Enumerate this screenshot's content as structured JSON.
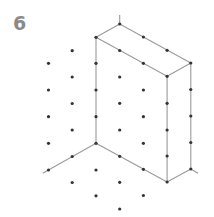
{
  "puzzle": {
    "number": "6",
    "title_color": "#8a8a8a"
  },
  "diagram": {
    "type": "isometric-dot-grid-drawing",
    "colors": {
      "dot": "#333333",
      "line": "#9a9a9a"
    },
    "dot_radius": 1.6,
    "dots": [
      [
        48.5,
        63.3
      ],
      [
        48.5,
        90
      ],
      [
        48.5,
        116.7
      ],
      [
        48.5,
        143.3
      ],
      [
        48.5,
        170
      ],
      [
        72.2,
        50.7
      ],
      [
        72.2,
        77
      ],
      [
        72.2,
        103.5
      ],
      [
        72.2,
        130
      ],
      [
        72.2,
        156.5
      ],
      [
        72.2,
        182.5
      ],
      [
        96,
        37.3
      ],
      [
        96,
        63.3
      ],
      [
        96,
        90
      ],
      [
        96,
        116.7
      ],
      [
        96,
        143.3
      ],
      [
        96,
        170
      ],
      [
        96,
        195.8
      ],
      [
        119.7,
        24
      ],
      [
        119.7,
        50.5
      ],
      [
        119.7,
        77
      ],
      [
        119.7,
        103.3
      ],
      [
        119.7,
        130
      ],
      [
        119.7,
        156.3
      ],
      [
        119.7,
        182.3
      ],
      [
        119.7,
        209
      ],
      [
        143.4,
        37
      ],
      [
        143.4,
        63.3
      ],
      [
        143.4,
        90
      ],
      [
        143.4,
        116.7
      ],
      [
        143.4,
        143.3
      ],
      [
        143.4,
        169.3
      ],
      [
        143.4,
        195.5
      ],
      [
        167.1,
        50.3
      ],
      [
        167.1,
        76.3
      ],
      [
        167.1,
        103.3
      ],
      [
        167.1,
        130
      ],
      [
        167.1,
        156
      ],
      [
        167.1,
        182
      ],
      [
        190.8,
        63
      ],
      [
        190.8,
        89.5
      ],
      [
        190.8,
        116
      ],
      [
        190.8,
        142.5
      ],
      [
        190.8,
        169
      ]
    ],
    "lines": [
      {
        "name": "box-top-left-edge",
        "from": [
          96,
          37.3
        ],
        "to": [
          119.7,
          24
        ]
      },
      {
        "name": "box-top-back-edge",
        "from": [
          119.7,
          24
        ],
        "to": [
          190.8,
          63
        ]
      },
      {
        "name": "box-top-right-edge",
        "from": [
          190.8,
          63
        ],
        "to": [
          167.1,
          76.3
        ]
      },
      {
        "name": "box-top-front-edge",
        "from": [
          167.1,
          76.3
        ],
        "to": [
          96,
          37.3
        ]
      },
      {
        "name": "top-stub",
        "from": [
          119.7,
          24
        ],
        "to": [
          119.7,
          15
        ]
      },
      {
        "name": "box-front-left-vertical",
        "from": [
          96,
          37.3
        ],
        "to": [
          96,
          143.3
        ]
      },
      {
        "name": "box-front-right-vertical",
        "from": [
          167.1,
          76.3
        ],
        "to": [
          167.1,
          182
        ]
      },
      {
        "name": "box-back-right-vertical",
        "from": [
          190.8,
          63
        ],
        "to": [
          190.8,
          169
        ]
      },
      {
        "name": "box-bottom-front-edge",
        "from": [
          96,
          143.3
        ],
        "to": [
          167.1,
          182
        ]
      },
      {
        "name": "box-bottom-right-edge",
        "from": [
          167.1,
          182
        ],
        "to": [
          190.8,
          169
        ]
      },
      {
        "name": "bottom-right-stub",
        "from": [
          190.8,
          169
        ],
        "to": [
          198,
          173.3
        ]
      },
      {
        "name": "left-diagonal-guide",
        "from": [
          96,
          143.3
        ],
        "to": [
          42.7,
          173.3
        ]
      }
    ]
  }
}
